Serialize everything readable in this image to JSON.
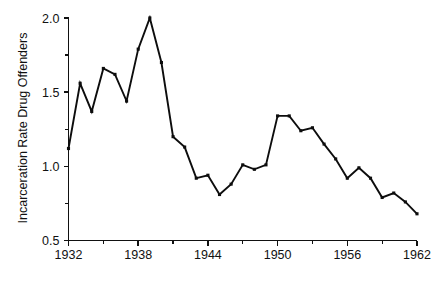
{
  "chart_data": {
    "type": "line",
    "title": "",
    "xlabel": "",
    "ylabel": "Incarceration Rate Drug Offenders",
    "xlim": [
      1932,
      1962
    ],
    "ylim": [
      0.5,
      2.0
    ],
    "grid": false,
    "legend": false,
    "x_tick_labels": [
      "1932",
      "1938",
      "1944",
      "1950",
      "1956",
      "1962"
    ],
    "x_tick_values": [
      1932,
      1938,
      1944,
      1950,
      1956,
      1962
    ],
    "x_minor_tick_values": [
      1935,
      1941,
      1947,
      1953,
      1959
    ],
    "y_tick_labels": [
      "0.5",
      "1.0",
      "1.5",
      "2.0"
    ],
    "y_tick_values": [
      0.5,
      1.0,
      1.5,
      2.0
    ],
    "y_minor_tick_values": [
      0.75,
      1.25,
      1.75
    ],
    "marker": "square",
    "line_color": "#0d0d0d",
    "x": [
      1932,
      1933,
      1934,
      1935,
      1936,
      1937,
      1938,
      1939,
      1940,
      1941,
      1942,
      1943,
      1944,
      1945,
      1946,
      1947,
      1948,
      1949,
      1950,
      1951,
      1952,
      1953,
      1954,
      1955,
      1956,
      1957,
      1958,
      1959,
      1960,
      1961,
      1962
    ],
    "values": [
      1.12,
      1.56,
      1.37,
      1.66,
      1.62,
      1.44,
      1.79,
      2.0,
      1.7,
      1.2,
      1.13,
      0.92,
      0.94,
      0.81,
      0.88,
      1.01,
      0.98,
      1.01,
      1.34,
      1.34,
      1.24,
      1.26,
      1.15,
      1.05,
      0.92,
      0.99,
      0.92,
      0.79,
      0.82,
      0.76,
      0.68
    ],
    "series": [
      {
        "name": "Incarceration Rate Drug Offenders",
        "values": [
          1.12,
          1.56,
          1.37,
          1.66,
          1.62,
          1.44,
          1.79,
          2.0,
          1.7,
          1.2,
          1.13,
          0.92,
          0.94,
          0.81,
          0.88,
          1.01,
          0.98,
          1.01,
          1.34,
          1.34,
          1.24,
          1.26,
          1.15,
          1.05,
          0.92,
          0.99,
          0.92,
          0.79,
          0.82,
          0.76,
          0.68
        ]
      }
    ]
  }
}
